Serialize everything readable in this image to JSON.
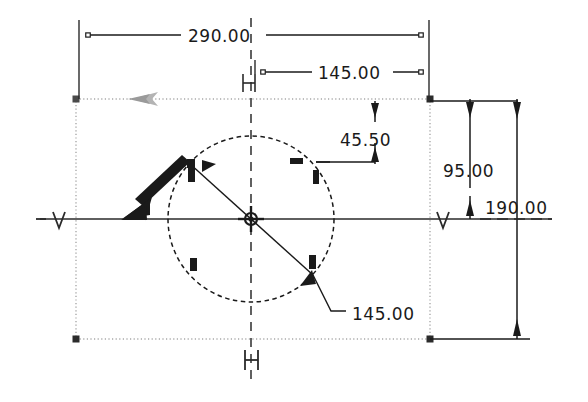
{
  "app": {
    "type": "cad-sketch-viewport",
    "background_color": "#ffffff"
  },
  "colors": {
    "line": "#1a1a1a",
    "dim_line": "#2a2a2a",
    "text": "#1a1a1a",
    "construction_dotted": "#9a9a9a",
    "centerline": "#3a3a3a",
    "highlight_arrow": "#8a8a8a",
    "handle": "#2b2b2b"
  },
  "dimensions": [
    {
      "id": "overall-width",
      "label": "290.00",
      "orientation": "horizontal",
      "value": 290.0
    },
    {
      "id": "center-x",
      "label": "145.00",
      "orientation": "horizontal",
      "value": 145.0
    },
    {
      "id": "circle-top-offset",
      "label": "45.50",
      "orientation": "vertical",
      "value": 45.5
    },
    {
      "id": "center-y",
      "label": "95.00",
      "orientation": "vertical",
      "value": 95.0
    },
    {
      "id": "overall-height",
      "label": "190.00",
      "orientation": "vertical",
      "value": 190.0
    },
    {
      "id": "circle-diameter",
      "label": "145.00",
      "orientation": "diameter",
      "value": 145.0
    }
  ],
  "constraints": [
    {
      "id": "horizontal-top",
      "symbol": "H",
      "kind": "horizontal"
    },
    {
      "id": "horizontal-bottom",
      "symbol": "H",
      "kind": "horizontal"
    },
    {
      "id": "vertical-left",
      "symbol": "V",
      "kind": "vertical"
    },
    {
      "id": "vertical-right",
      "symbol": "V",
      "kind": "vertical"
    }
  ],
  "geometry": {
    "rectangle": {
      "name": "construction-rectangle",
      "style": "dotted"
    },
    "circle": {
      "name": "sketch-circle",
      "style": "dashed"
    },
    "center_mark": {
      "name": "circle-center-point"
    },
    "diameter_line": {
      "name": "diameter-leader-line"
    },
    "drag_arrow": {
      "name": "drag-direction-arrow"
    }
  }
}
